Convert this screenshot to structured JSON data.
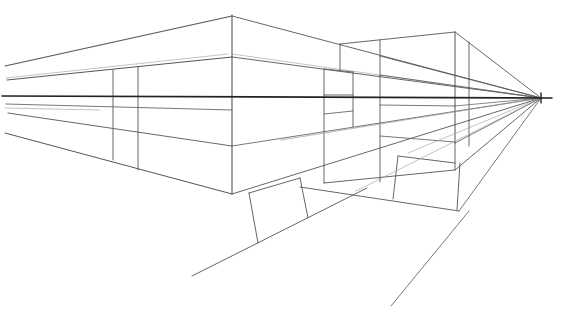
{
  "drawing": {
    "title": "One-point perspective sketch",
    "colors": {
      "background": "#ffffff",
      "line": "#555555",
      "horizon": "#222222",
      "faint": "#9a9a9a"
    },
    "vanishing_point": {
      "x": 541,
      "y": 98
    },
    "horizon": {
      "x1": 2,
      "y1": 96,
      "x2": 552,
      "y2": 98
    },
    "lines": [
      {
        "x1": 5,
        "y1": 66,
        "x2": 232,
        "y2": 16,
        "w": 1.1
      },
      {
        "x1": 232,
        "y1": 16,
        "x2": 541,
        "y2": 98,
        "w": 0.9
      },
      {
        "x1": 232,
        "y1": 15,
        "x2": 232,
        "y2": 194,
        "w": 1.1
      },
      {
        "x1": 7,
        "y1": 80,
        "x2": 232,
        "y2": 57,
        "w": 1
      },
      {
        "x1": 6,
        "y1": 78,
        "x2": 228,
        "y2": 54,
        "w": 0.6,
        "c": "faint"
      },
      {
        "x1": 232,
        "y1": 57,
        "x2": 541,
        "y2": 98,
        "w": 0.9
      },
      {
        "x1": 232,
        "y1": 54,
        "x2": 541,
        "y2": 98,
        "w": 0.6,
        "c": "faint"
      },
      {
        "x1": 113,
        "y1": 70,
        "x2": 113,
        "y2": 160,
        "w": 0.9
      },
      {
        "x1": 138,
        "y1": 67,
        "x2": 138,
        "y2": 170,
        "w": 0.9
      },
      {
        "x1": 6,
        "y1": 104,
        "x2": 232,
        "y2": 110,
        "w": 0.8
      },
      {
        "x1": 8,
        "y1": 113,
        "x2": 232,
        "y2": 146,
        "w": 0.9
      },
      {
        "x1": 5,
        "y1": 133,
        "x2": 232,
        "y2": 194,
        "w": 1
      },
      {
        "x1": 232,
        "y1": 146,
        "x2": 541,
        "y2": 98,
        "w": 0.8
      },
      {
        "x1": 232,
        "y1": 194,
        "x2": 541,
        "y2": 98,
        "w": 0.9
      },
      {
        "x1": 340,
        "y1": 44,
        "x2": 455,
        "y2": 32,
        "w": 0.9
      },
      {
        "x1": 340,
        "y1": 44,
        "x2": 340,
        "y2": 70,
        "w": 0.9
      },
      {
        "x1": 455,
        "y1": 32,
        "x2": 455,
        "y2": 143,
        "w": 1
      },
      {
        "x1": 455,
        "y1": 32,
        "x2": 541,
        "y2": 98,
        "w": 0.9
      },
      {
        "x1": 469,
        "y1": 42,
        "x2": 469,
        "y2": 146,
        "w": 0.9
      },
      {
        "x1": 380,
        "y1": 40,
        "x2": 380,
        "y2": 182,
        "w": 0.9
      },
      {
        "x1": 324,
        "y1": 69,
        "x2": 324,
        "y2": 183,
        "w": 0.9
      },
      {
        "x1": 324,
        "y1": 69,
        "x2": 353,
        "y2": 72,
        "w": 0.9
      },
      {
        "x1": 353,
        "y1": 72,
        "x2": 353,
        "y2": 127,
        "w": 0.9
      },
      {
        "x1": 324,
        "y1": 95,
        "x2": 353,
        "y2": 95,
        "w": 0.9
      },
      {
        "x1": 324,
        "y1": 114,
        "x2": 353,
        "y2": 111,
        "w": 0.8
      },
      {
        "x1": 380,
        "y1": 56,
        "x2": 541,
        "y2": 98,
        "w": 0.8
      },
      {
        "x1": 380,
        "y1": 75,
        "x2": 541,
        "y2": 98,
        "w": 0.8
      },
      {
        "x1": 380,
        "y1": 105,
        "x2": 455,
        "y2": 106,
        "w": 0.8
      },
      {
        "x1": 380,
        "y1": 136,
        "x2": 455,
        "y2": 142,
        "w": 0.8
      },
      {
        "x1": 455,
        "y1": 106,
        "x2": 541,
        "y2": 98,
        "w": 0.7
      },
      {
        "x1": 281,
        "y1": 140,
        "x2": 541,
        "y2": 98,
        "w": 0.7,
        "c": "faint"
      },
      {
        "x1": 324,
        "y1": 183,
        "x2": 455,
        "y2": 170,
        "w": 0.9
      },
      {
        "x1": 455,
        "y1": 170,
        "x2": 541,
        "y2": 98,
        "w": 0.9
      },
      {
        "x1": 455,
        "y1": 143,
        "x2": 541,
        "y2": 98,
        "w": 0.8
      },
      {
        "x1": 455,
        "y1": 143,
        "x2": 455,
        "y2": 170,
        "w": 0.9
      },
      {
        "x1": 300,
        "y1": 187,
        "x2": 459,
        "y2": 211,
        "w": 0.9
      },
      {
        "x1": 398,
        "y1": 156,
        "x2": 455,
        "y2": 163,
        "w": 0.9
      },
      {
        "x1": 398,
        "y1": 156,
        "x2": 393,
        "y2": 199,
        "w": 0.9
      },
      {
        "x1": 460,
        "y1": 163,
        "x2": 457,
        "y2": 210,
        "w": 0.9
      },
      {
        "x1": 459,
        "y1": 211,
        "x2": 541,
        "y2": 98,
        "w": 0.8
      },
      {
        "x1": 391,
        "y1": 306,
        "x2": 469,
        "y2": 211,
        "w": 0.8
      },
      {
        "x1": 249,
        "y1": 193,
        "x2": 300,
        "y2": 178,
        "w": 0.9
      },
      {
        "x1": 249,
        "y1": 193,
        "x2": 258,
        "y2": 243,
        "w": 0.9
      },
      {
        "x1": 300,
        "y1": 178,
        "x2": 308,
        "y2": 218,
        "w": 0.9
      },
      {
        "x1": 192,
        "y1": 276,
        "x2": 367,
        "y2": 188,
        "w": 0.9
      },
      {
        "x1": 356,
        "y1": 191,
        "x2": 541,
        "y2": 98,
        "w": 0.6,
        "c": "faint"
      },
      {
        "x1": 408,
        "y1": 153,
        "x2": 541,
        "y2": 98,
        "w": 0.6,
        "c": "faint"
      },
      {
        "x1": 5,
        "y1": 108,
        "x2": 100,
        "y2": 110,
        "w": 0.6,
        "c": "faint"
      }
    ]
  }
}
